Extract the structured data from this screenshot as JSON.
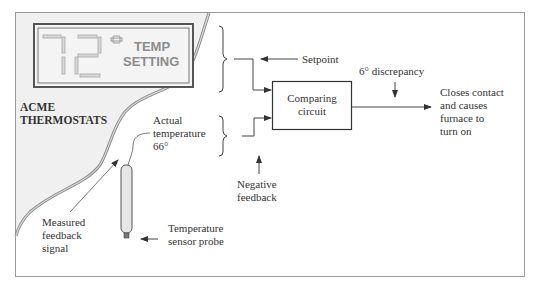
{
  "diagram": {
    "type": "thermostat-feedback-control",
    "colors": {
      "frame": "#9a9a9a",
      "panel_fill": "#f0f0f0",
      "panel_edge": "#8a8a8a",
      "display_border": "#555555",
      "segment_fill": "#d8d8d8",
      "segment_stroke": "#a8a8a8",
      "text": "#333333",
      "display_text": "#8c8c8c",
      "line": "#444444"
    },
    "thermostat": {
      "brand_line1": "ACME",
      "brand_line2": "THERMOSTATS",
      "display_value": "72",
      "display_label_line1": "TEMP",
      "display_label_line2": "SETTING",
      "display_icon": "degree-indicator-icon"
    },
    "labels": {
      "setpoint": "Setpoint",
      "actual_temp_line1": "Actual",
      "actual_temp_line2": "temperature",
      "actual_temp_line3": "66°",
      "comparing_line1": "Comparing",
      "comparing_line2": "circuit",
      "discrepancy": "6° discrepancy",
      "output_line1": "Closes contact",
      "output_line2": "and causes",
      "output_line3": "furnace to",
      "output_line4": "turn on",
      "negative_line1": "Negative",
      "negative_line2": "feedback",
      "measured_line1": "Measured",
      "measured_line2": "feedback",
      "measured_line3": "signal",
      "probe_line1": "Temperature",
      "probe_line2": "sensor probe"
    },
    "icons": {
      "probe": "temperature-probe-icon",
      "arrow": "arrow-icon",
      "brace": "brace-icon"
    }
  }
}
